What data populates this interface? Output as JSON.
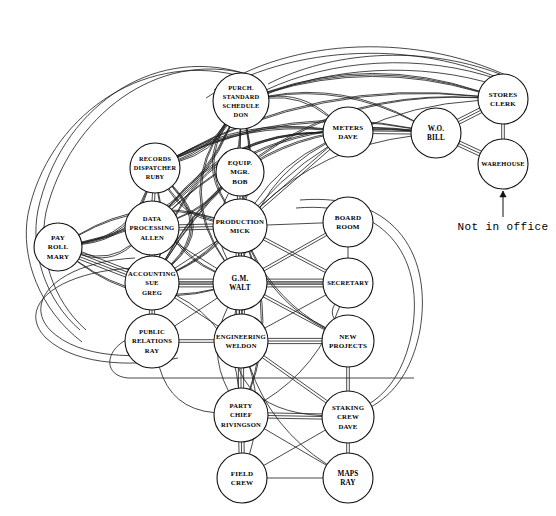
{
  "diagram": {
    "annotation": {
      "label": "Not in office",
      "target_node": "warehouse"
    },
    "nodes": [
      {
        "id": "purch",
        "lines": [
          "PURCH.",
          "STANDARD",
          "SCHEDULE",
          "DON"
        ],
        "x": 241,
        "y": 101,
        "r": 28,
        "font": 6.4
      },
      {
        "id": "records",
        "lines": [
          "RECORDS",
          "DISPATCHER",
          "RUBY"
        ],
        "x": 155,
        "y": 168,
        "r": 25,
        "font": 6.3
      },
      {
        "id": "equip",
        "lines": [
          "EQUIP.",
          "MGR.",
          "BOB"
        ],
        "x": 240,
        "y": 172,
        "r": 24,
        "font": 7.0
      },
      {
        "id": "meters",
        "lines": [
          "METERS",
          "DAVE"
        ],
        "x": 348,
        "y": 132,
        "r": 25,
        "font": 7.0
      },
      {
        "id": "wo",
        "lines": [
          "W.O.",
          "BILL"
        ],
        "x": 436,
        "y": 133,
        "r": 25,
        "font": 7.2
      },
      {
        "id": "stores",
        "lines": [
          "STORES",
          "CLERK"
        ],
        "x": 503,
        "y": 99,
        "r": 25,
        "font": 7.0
      },
      {
        "id": "warehouse",
        "lines": [
          "WAREHOUSE"
        ],
        "x": 503,
        "y": 164,
        "r": 25,
        "font": 6.4
      },
      {
        "id": "payroll",
        "lines": [
          "PAY",
          "ROLL",
          "MARY"
        ],
        "x": 58,
        "y": 247,
        "r": 24,
        "font": 7.0
      },
      {
        "id": "dataproc",
        "lines": [
          "DATA",
          "PROCESSING",
          "ALLEN"
        ],
        "x": 152,
        "y": 228,
        "r": 27,
        "font": 6.6
      },
      {
        "id": "production",
        "lines": [
          "PRODUCTION",
          "MICK"
        ],
        "x": 240,
        "y": 226,
        "r": 27,
        "font": 6.8
      },
      {
        "id": "boardroom",
        "lines": [
          "BOARD",
          "ROOM"
        ],
        "x": 348,
        "y": 222,
        "r": 25,
        "font": 7.0
      },
      {
        "id": "accounting",
        "lines": [
          "ACCOUNTING",
          "SUE",
          "GREG"
        ],
        "x": 152,
        "y": 283,
        "r": 27,
        "font": 6.6
      },
      {
        "id": "gm",
        "lines": [
          "G.M.",
          "WALT"
        ],
        "x": 240,
        "y": 283,
        "r": 27,
        "font": 7.2
      },
      {
        "id": "secretary",
        "lines": [
          "SECRETARY"
        ],
        "x": 348,
        "y": 283,
        "r": 25,
        "font": 6.6
      },
      {
        "id": "pubrel",
        "lines": [
          "PUBLIC",
          "RELATIONS",
          "RAY"
        ],
        "x": 152,
        "y": 341,
        "r": 27,
        "font": 6.6
      },
      {
        "id": "engineering",
        "lines": [
          "ENGINEERING",
          "WELDON"
        ],
        "x": 241,
        "y": 341,
        "r": 27,
        "font": 6.6
      },
      {
        "id": "newproj",
        "lines": [
          "NEW",
          "PROJECTS"
        ],
        "x": 348,
        "y": 341,
        "r": 26,
        "font": 7.0
      },
      {
        "id": "partychief",
        "lines": [
          "PARTY",
          "CHIEF",
          "RIVINGSON"
        ],
        "x": 241,
        "y": 415,
        "r": 27,
        "font": 6.6
      },
      {
        "id": "staking",
        "lines": [
          "STAKING",
          "CREW",
          "DAVE"
        ],
        "x": 348,
        "y": 417,
        "r": 26,
        "font": 6.8
      },
      {
        "id": "fieldcrew",
        "lines": [
          "FIELD",
          "CREW"
        ],
        "x": 242,
        "y": 478,
        "r": 25,
        "font": 7.0
      },
      {
        "id": "maps",
        "lines": [
          "MAPS",
          "RAY"
        ],
        "x": 348,
        "y": 478,
        "r": 25,
        "font": 7.2
      }
    ],
    "edges": [
      {
        "from": "stores",
        "to": "warehouse",
        "weight": 2
      },
      {
        "from": "stores",
        "to": "wo",
        "weight": 3
      },
      {
        "from": "wo",
        "to": "warehouse",
        "weight": 3
      },
      {
        "from": "wo",
        "to": "meters",
        "weight": 2
      },
      {
        "from": "meters",
        "to": "production",
        "weight": 2
      },
      {
        "from": "equip",
        "to": "production",
        "weight": 3
      },
      {
        "from": "records",
        "to": "dataproc",
        "weight": 2
      },
      {
        "from": "purch",
        "to": "equip",
        "weight": 1
      },
      {
        "from": "dataproc",
        "to": "production",
        "weight": 3
      },
      {
        "from": "dataproc",
        "to": "accounting",
        "weight": 3
      },
      {
        "from": "dataproc",
        "to": "gm",
        "weight": 1
      },
      {
        "from": "production",
        "to": "gm",
        "weight": 4
      },
      {
        "from": "production",
        "to": "boardroom",
        "weight": 1
      },
      {
        "from": "production",
        "to": "secretary",
        "weight": 2
      },
      {
        "from": "production",
        "to": "engineering",
        "weight": 2
      },
      {
        "from": "production",
        "to": "accounting",
        "weight": 1
      },
      {
        "from": "accounting",
        "to": "gm",
        "weight": 4
      },
      {
        "from": "accounting",
        "to": "pubrel",
        "weight": 3
      },
      {
        "from": "accounting",
        "to": "payroll",
        "weight": 4
      },
      {
        "from": "accounting",
        "to": "engineering",
        "weight": 1
      },
      {
        "from": "accounting",
        "to": "secretary",
        "weight": 1
      },
      {
        "from": "gm",
        "to": "secretary",
        "weight": 4
      },
      {
        "from": "gm",
        "to": "engineering",
        "weight": 4
      },
      {
        "from": "gm",
        "to": "boardroom",
        "weight": 2
      },
      {
        "from": "gm",
        "to": "newproj",
        "weight": 2
      },
      {
        "from": "gm",
        "to": "pubrel",
        "weight": 1
      },
      {
        "from": "boardroom",
        "to": "secretary",
        "weight": 1
      },
      {
        "from": "pubrel",
        "to": "engineering",
        "weight": 2
      },
      {
        "from": "engineering",
        "to": "newproj",
        "weight": 3
      },
      {
        "from": "engineering",
        "to": "partychief",
        "weight": 3
      },
      {
        "from": "engineering",
        "to": "staking",
        "weight": 2
      },
      {
        "from": "engineering",
        "to": "secretary",
        "weight": 1
      },
      {
        "from": "newproj",
        "to": "staking",
        "weight": 2
      },
      {
        "from": "partychief",
        "to": "staking",
        "weight": 3
      },
      {
        "from": "partychief",
        "to": "fieldcrew",
        "weight": 3
      },
      {
        "from": "partychief",
        "to": "maps",
        "weight": 1
      },
      {
        "from": "staking",
        "to": "maps",
        "weight": 2
      },
      {
        "from": "staking",
        "to": "fieldcrew",
        "weight": 1
      },
      {
        "from": "fieldcrew",
        "to": "maps",
        "weight": 1
      }
    ],
    "curved_edges": [
      {
        "from": "purch",
        "to": "payroll",
        "bow": -62,
        "weight": 3
      },
      {
        "from": "purch",
        "to": "accounting",
        "bow": -78,
        "weight": 3
      },
      {
        "from": "purch",
        "to": "dataproc",
        "bow": -52,
        "weight": 2
      },
      {
        "from": "purch",
        "to": "records",
        "bow": -20,
        "weight": 3
      },
      {
        "from": "purch",
        "to": "stores",
        "bow": -42,
        "weight": 3
      },
      {
        "from": "purch",
        "to": "wo",
        "bow": -34,
        "weight": 2
      },
      {
        "from": "purch",
        "to": "meters",
        "bow": -24,
        "weight": 2
      },
      {
        "from": "purch",
        "to": "gm",
        "bow": 64,
        "weight": 2
      },
      {
        "from": "purch",
        "to": "production",
        "bow": 40,
        "weight": 2
      },
      {
        "from": "records",
        "to": "payroll",
        "bow": -38,
        "weight": 3
      },
      {
        "from": "records",
        "to": "accounting",
        "bow": -58,
        "weight": 3
      },
      {
        "from": "records",
        "to": "gm",
        "bow": 40,
        "weight": 2
      },
      {
        "from": "records",
        "to": "stores",
        "bow": -56,
        "weight": 2
      },
      {
        "from": "records",
        "to": "wo",
        "bow": -46,
        "weight": 2
      },
      {
        "from": "records",
        "to": "meters",
        "bow": -30,
        "weight": 3
      },
      {
        "from": "records",
        "to": "production",
        "bow": 22,
        "weight": 2
      },
      {
        "from": "payroll",
        "to": "dataproc",
        "bow": 26,
        "weight": 2
      },
      {
        "from": "payroll",
        "to": "gm",
        "bow": 44,
        "weight": 2
      },
      {
        "from": "payroll",
        "to": "production",
        "bow": -40,
        "weight": 2
      },
      {
        "from": "accounting",
        "to": "meters",
        "bow": -92,
        "weight": 2
      },
      {
        "from": "accounting",
        "to": "stores",
        "bow": -118,
        "weight": 2
      },
      {
        "from": "accounting",
        "to": "wo",
        "bow": -104,
        "weight": 2
      },
      {
        "from": "dataproc",
        "to": "meters",
        "bow": -52,
        "weight": 2
      },
      {
        "from": "dataproc",
        "to": "wo",
        "bow": -70,
        "weight": 2
      },
      {
        "from": "gm",
        "to": "staking",
        "bow": 96,
        "weight": 1
      },
      {
        "from": "gm",
        "to": "partychief",
        "bow": 34,
        "weight": 1
      },
      {
        "from": "accounting",
        "to": "partychief",
        "bow": -44,
        "weight": 1
      },
      {
        "from": "pubrel",
        "to": "partychief",
        "bow": 40,
        "weight": 1
      },
      {
        "from": "production",
        "to": "newproj",
        "bow": 26,
        "weight": 2
      },
      {
        "from": "production",
        "to": "partychief",
        "bow": -34,
        "weight": 2
      },
      {
        "from": "engineering",
        "to": "maps",
        "bow": 30,
        "weight": 1
      },
      {
        "from": "engineering",
        "to": "fieldcrew",
        "bow": -22,
        "weight": 1
      },
      {
        "from": "secretary",
        "to": "newproj",
        "bow": 18,
        "weight": 1
      },
      {
        "from": "secretary",
        "to": "partychief",
        "bow": -30,
        "weight": 1
      },
      {
        "from": "meters",
        "to": "gm",
        "bow": 46,
        "weight": 1
      },
      {
        "from": "meters",
        "to": "production",
        "bow": 20,
        "weight": 1
      },
      {
        "from": "equip",
        "to": "gm",
        "bow": 30,
        "weight": 1
      },
      {
        "from": "wo",
        "to": "production",
        "bow": 36,
        "weight": 1
      },
      {
        "from": "stores",
        "to": "production",
        "bow": 60,
        "weight": 1
      }
    ],
    "long_arcs": [
      {
        "id": "arc-outer-1",
        "d": "M 243 73 C 150 45 60 110 38 210 C 30 250 45 300 80 330",
        "weight": 1
      },
      {
        "id": "arc-outer-2",
        "d": "M 247 74 C 158 50 70 115 46 212 C 38 252 52 300 86 330",
        "weight": 1
      },
      {
        "id": "arc-outer-3",
        "d": "M 236 75 C 140 52 48 118 28 214 C 20 258 40 310 82 342",
        "weight": 1
      },
      {
        "id": "arc-top-1",
        "d": "M 268 84 C 330 52 420 44 500 74",
        "weight": 1
      },
      {
        "id": "arc-top-2",
        "d": "M 266 90 C 330 60 420 52 500 80",
        "weight": 1
      },
      {
        "id": "arc-top-3",
        "d": "M 262 96 C 328 68 418 60 499 86",
        "weight": 1
      },
      {
        "id": "arc-top-4",
        "d": "M 214 90 C 290 38 420 30 520 82",
        "weight": 1
      },
      {
        "id": "arc-top-5",
        "d": "M 206 98 C 288 44 424 36 524 90",
        "weight": 1
      },
      {
        "id": "arc-left-1",
        "d": "M 135 258 C 60 262 22 300 50 330 C 80 360 140 358 175 352",
        "weight": 1
      },
      {
        "id": "arc-left-2",
        "d": "M 133 268 C 54 272 16 308 46 338 C 78 368 142 366 178 358",
        "weight": 1
      },
      {
        "id": "arc-bot-1",
        "d": "M 126 340 C 104 352 104 376 128 378 L 414 378",
        "weight": 1
      },
      {
        "id": "arc-right-1",
        "d": "M 300 200 C 400 192 432 260 420 330 C 408 392 372 414 330 420",
        "weight": 1
      },
      {
        "id": "arc-right-2",
        "d": "M 296 208 C 392 200 424 264 412 332 C 400 392 368 412 328 418",
        "weight": 1
      }
    ]
  }
}
